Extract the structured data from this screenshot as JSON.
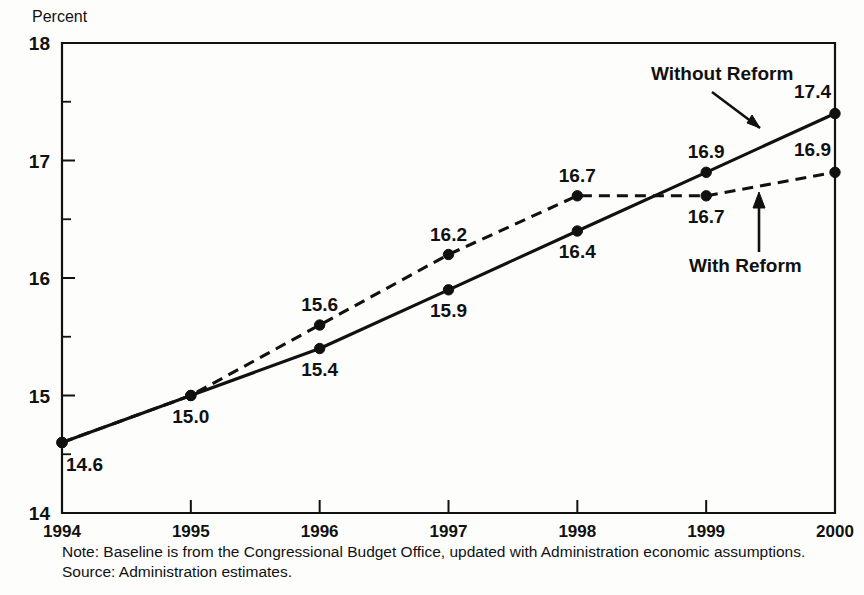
{
  "chart_data": {
    "type": "line",
    "title": "",
    "ylabel": "Percent",
    "xlabel": "",
    "categories": [
      "1994",
      "1995",
      "1996",
      "1997",
      "1998",
      "1999",
      "2000"
    ],
    "x": [
      1994,
      1995,
      1996,
      1997,
      1998,
      1999,
      2000
    ],
    "ylim": [
      14,
      18
    ],
    "xlim": [
      1994,
      2000
    ],
    "y_ticks": [
      "14",
      "15",
      "16",
      "17",
      "18"
    ],
    "y_tick_values": [
      14,
      15,
      16,
      17,
      18
    ],
    "y_minor_ticks": [
      14.5,
      15.5,
      16.5,
      17.5
    ],
    "grid": false,
    "legend_position": "inline-annotations",
    "series": [
      {
        "name": "Without Reform",
        "style": "solid",
        "marker": "filled-circle",
        "values": [
          14.6,
          15.0,
          15.4,
          15.9,
          16.4,
          16.9,
          17.4
        ],
        "labels": [
          "14.6",
          "15.0",
          "15.4",
          "15.9",
          "16.4",
          "16.9",
          "17.4"
        ],
        "label_positions": [
          "below",
          "below",
          "below",
          "below",
          "below",
          "above",
          "above"
        ]
      },
      {
        "name": "With Reform",
        "style": "dashed",
        "marker": "filled-circle",
        "values": [
          14.6,
          15.0,
          15.6,
          16.2,
          16.7,
          16.7,
          16.9
        ],
        "labels": [
          "14.6",
          "15.0",
          "15.6",
          "16.2",
          "16.7",
          "16.7",
          "16.9"
        ],
        "label_positions": [
          "below",
          "below",
          "above",
          "above",
          "above",
          "below",
          "above"
        ]
      }
    ],
    "annotations": [
      {
        "text": "Without Reform",
        "arrow": "down-right",
        "target_series": "Without Reform"
      },
      {
        "text": "With Reform",
        "arrow": "up",
        "target_series": "With Reform"
      }
    ],
    "notes": [
      "Note: Baseline is from the Congressional Budget Office, updated with  Administration economic assumptions.",
      "Source: Administration estimates."
    ]
  },
  "axis": {
    "y_title": "Percent"
  },
  "colors": {
    "ink": "#111111",
    "background": "#fdfdfc"
  }
}
